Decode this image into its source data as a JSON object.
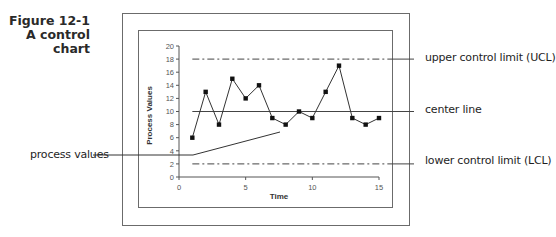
{
  "figure": {
    "caption_line1": "Figure 12-1",
    "caption_line2": "A control",
    "caption_line3": "chart"
  },
  "callouts": {
    "ucl": "upper control limit (UCL)",
    "center": "center line",
    "lcl": "lower control limit (LCL)",
    "process": "process values"
  },
  "chart_data": {
    "type": "line",
    "title": "",
    "xlabel": "Time",
    "ylabel": "Process Values",
    "x": [
      1,
      2,
      3,
      4,
      5,
      6,
      7,
      8,
      9,
      10,
      11,
      12,
      13,
      14,
      15
    ],
    "series": [
      {
        "name": "process values",
        "values": [
          6,
          13,
          8,
          15,
          12,
          14,
          9,
          8,
          10,
          9,
          13,
          17,
          9,
          8,
          9
        ]
      }
    ],
    "reference_lines": [
      {
        "name": "upper control limit (UCL)",
        "y": 18,
        "style": "dash-dot"
      },
      {
        "name": "center line",
        "y": 10,
        "style": "solid"
      },
      {
        "name": "lower control limit (LCL)",
        "y": 2,
        "style": "dash-dot"
      }
    ],
    "xlim": [
      0,
      15
    ],
    "ylim": [
      0,
      20
    ],
    "xticks": [
      0,
      5,
      10,
      15
    ],
    "yticks": [
      0,
      2,
      4,
      6,
      8,
      10,
      12,
      14,
      16,
      18,
      20
    ],
    "grid": false,
    "legend": "none"
  },
  "colors": {
    "line": "#333333",
    "frame": "#6b6b6b",
    "text": "#222222"
  }
}
